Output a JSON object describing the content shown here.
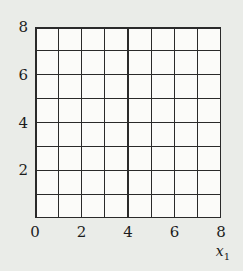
{
  "figure": {
    "xlabel": {
      "base": "x",
      "sub": "1"
    }
  },
  "chart_data": {
    "type": "scatter",
    "series": [],
    "title": "",
    "xlabel": "x_1",
    "ylabel": "",
    "xlim": [
      0,
      8
    ],
    "ylim": [
      0,
      8
    ],
    "x_ticks": [
      0,
      2,
      4,
      6,
      8
    ],
    "y_ticks": [
      8,
      6,
      4,
      2
    ],
    "grid": true,
    "grid_step": 1,
    "legend": false,
    "colors": {
      "page_background": "#eaece8",
      "plot_background": "#fbfbf9",
      "grid_line": "#2a2a2a",
      "text": "#1c1c1c"
    }
  }
}
